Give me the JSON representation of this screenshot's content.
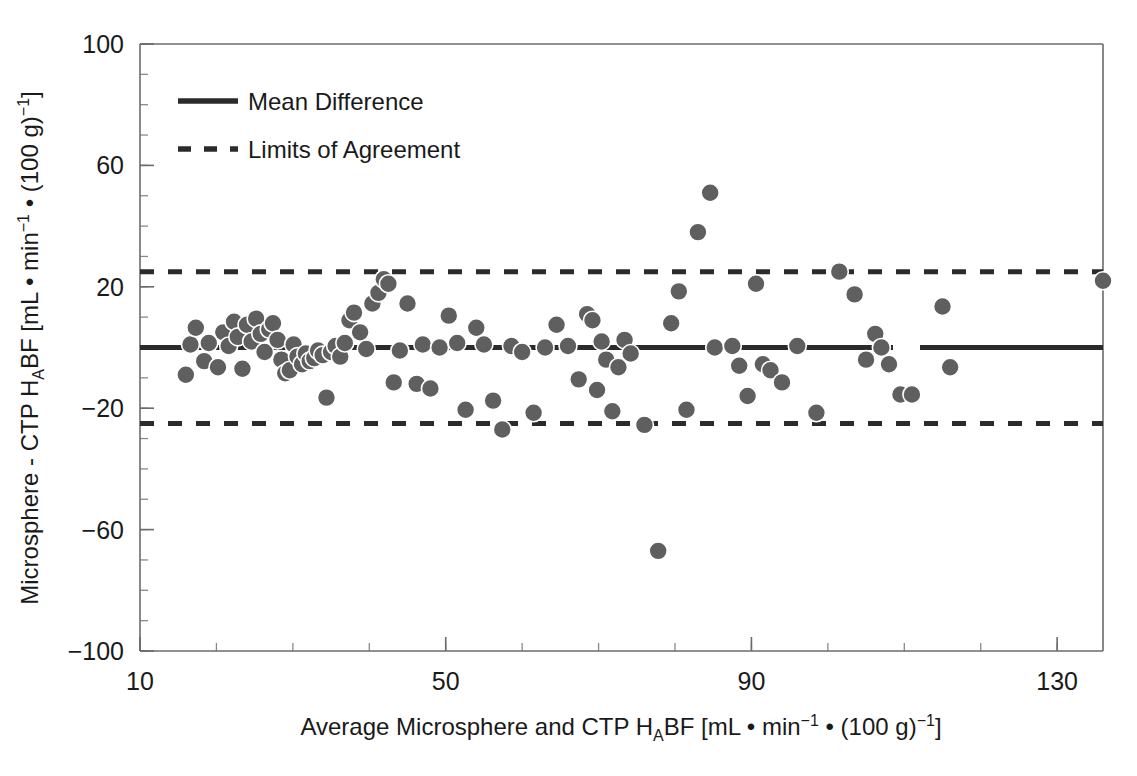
{
  "chart_data": {
    "type": "scatter",
    "title": "",
    "xlabel": "Average Microsphere and CTP HABF [mL • min⁻¹ • (100 g)⁻¹]",
    "ylabel": "Microsphere - CTP HABF [mL • min⁻¹ • (100 g)⁻¹]",
    "xlabel_parts": {
      "before_sub": "Average Microsphere and CTP H",
      "sub": "A",
      "after_sub": "BF [mL • min",
      "sup1": "−1",
      "mid": " • (100 g)",
      "sup2": "−1",
      "tail": "]"
    },
    "ylabel_parts": {
      "before_sub": "Microsphere - CTP H",
      "sub": "A",
      "after_sub": "BF [mL • min",
      "sup1": "−1",
      "mid": " • (100 g)",
      "sup2": "−1",
      "tail": "]"
    },
    "xlim": [
      10,
      136
    ],
    "ylim": [
      -100,
      100
    ],
    "xticks": [
      10,
      50,
      90,
      130
    ],
    "xtick_labels": [
      "10",
      "50",
      "90",
      "130"
    ],
    "xtick_minor_step": 10,
    "yticks": [
      100,
      60,
      20,
      -20,
      -60,
      -100
    ],
    "ytick_labels": [
      "100",
      "60",
      "20",
      "−20",
      "−60",
      "−100"
    ],
    "ytick_minor_step": 10,
    "grid": false,
    "legend_position": "top-left",
    "legend": [
      {
        "label": "Mean Difference",
        "style": "solid"
      },
      {
        "label": "Limits of Agreement",
        "style": "dashed"
      }
    ],
    "reference_lines": [
      {
        "name": "mean-difference",
        "value": 0,
        "style": "solid"
      },
      {
        "name": "upper-limit-of-agreement",
        "value": 25,
        "style": "dashed"
      },
      {
        "name": "lower-limit-of-agreement",
        "value": -25,
        "style": "dashed"
      }
    ],
    "marker": {
      "shape": "circle",
      "fill_color": "#5f5f5f",
      "edge_color": "#ffffff",
      "size_px": 18
    },
    "points": [
      [
        16.0,
        -9.0
      ],
      [
        16.6,
        1.0
      ],
      [
        17.3,
        6.5
      ],
      [
        18.4,
        -4.5
      ],
      [
        19.0,
        1.5
      ],
      [
        20.2,
        -6.5
      ],
      [
        20.9,
        5.0
      ],
      [
        21.6,
        0.5
      ],
      [
        22.3,
        8.5
      ],
      [
        22.8,
        3.5
      ],
      [
        23.4,
        -7.0
      ],
      [
        24.0,
        7.5
      ],
      [
        24.6,
        2.0
      ],
      [
        25.2,
        9.5
      ],
      [
        25.8,
        4.5
      ],
      [
        26.3,
        -1.5
      ],
      [
        26.9,
        6.0
      ],
      [
        27.4,
        8.0
      ],
      [
        28.0,
        2.5
      ],
      [
        28.5,
        -4.0
      ],
      [
        29.0,
        -8.5
      ],
      [
        29.6,
        -7.5
      ],
      [
        30.1,
        1.0
      ],
      [
        30.6,
        -3.0
      ],
      [
        31.2,
        -5.5
      ],
      [
        31.7,
        -2.0
      ],
      [
        32.2,
        -4.5
      ],
      [
        32.8,
        -3.5
      ],
      [
        33.3,
        -1.0
      ],
      [
        33.9,
        -2.5
      ],
      [
        34.4,
        -16.5
      ],
      [
        35.0,
        -1.5
      ],
      [
        35.6,
        0.5
      ],
      [
        36.2,
        -3.0
      ],
      [
        36.8,
        1.5
      ],
      [
        37.4,
        9.0
      ],
      [
        38.0,
        11.5
      ],
      [
        38.8,
        5.0
      ],
      [
        39.6,
        -0.5
      ],
      [
        40.4,
        14.5
      ],
      [
        41.2,
        18.0
      ],
      [
        41.9,
        22.5
      ],
      [
        42.5,
        21.0
      ],
      [
        43.2,
        -11.5
      ],
      [
        44.0,
        -1.0
      ],
      [
        45.0,
        14.5
      ],
      [
        46.2,
        -12.0
      ],
      [
        47.0,
        1.0
      ],
      [
        48.0,
        -13.5
      ],
      [
        49.2,
        0.0
      ],
      [
        50.4,
        10.5
      ],
      [
        51.5,
        1.5
      ],
      [
        52.6,
        -20.5
      ],
      [
        54.0,
        6.5
      ],
      [
        55.0,
        1.0
      ],
      [
        56.2,
        -17.5
      ],
      [
        57.4,
        -27.0
      ],
      [
        58.6,
        0.5
      ],
      [
        60.0,
        -1.5
      ],
      [
        61.5,
        -21.5
      ],
      [
        63.0,
        0.0
      ],
      [
        64.5,
        7.5
      ],
      [
        66.0,
        0.5
      ],
      [
        67.4,
        -10.5
      ],
      [
        68.5,
        11.0
      ],
      [
        69.2,
        9.0
      ],
      [
        69.8,
        -14.0
      ],
      [
        70.4,
        2.0
      ],
      [
        71.0,
        -4.0
      ],
      [
        71.8,
        -21.0
      ],
      [
        72.6,
        -6.5
      ],
      [
        73.4,
        2.5
      ],
      [
        74.2,
        -2.0
      ],
      [
        76.0,
        -25.5
      ],
      [
        77.8,
        -67.0
      ],
      [
        79.5,
        8.0
      ],
      [
        80.5,
        18.5
      ],
      [
        81.5,
        -20.5
      ],
      [
        83.0,
        38.0
      ],
      [
        84.6,
        51.0
      ],
      [
        85.2,
        0.0
      ],
      [
        87.5,
        0.5
      ],
      [
        88.4,
        -6.0
      ],
      [
        89.5,
        -16.0
      ],
      [
        90.6,
        21.0
      ],
      [
        91.5,
        -5.5
      ],
      [
        92.5,
        -7.5
      ],
      [
        94.0,
        -11.5
      ],
      [
        96.0,
        0.5
      ],
      [
        98.5,
        -21.5
      ],
      [
        101.5,
        25.0
      ],
      [
        103.5,
        17.5
      ],
      [
        105.0,
        -4.0
      ],
      [
        106.2,
        4.5
      ],
      [
        107.0,
        0.0
      ],
      [
        108.0,
        -5.5
      ],
      [
        109.5,
        -15.5
      ],
      [
        111.0,
        -15.5
      ],
      [
        115.0,
        13.5
      ],
      [
        116.0,
        -6.5
      ],
      [
        136.0,
        22.0
      ]
    ]
  }
}
